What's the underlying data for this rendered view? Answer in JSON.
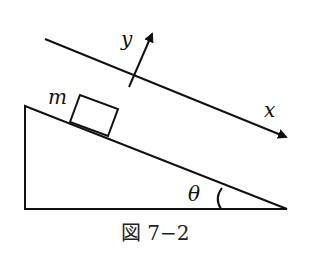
{
  "diagram": {
    "labels": {
      "mass": "m",
      "x_axis": "x",
      "y_axis": "y",
      "angle": "θ"
    },
    "caption": "図 7−2",
    "colors": {
      "stroke": "#111111",
      "background": "#ffffff"
    }
  }
}
